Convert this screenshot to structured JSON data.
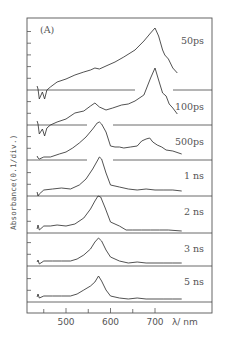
{
  "chart_data": {
    "type": "line",
    "panel_label": "(A)",
    "title": "",
    "xlabel": "λ/ nm",
    "ylabel": "Absorbance(0.1/div.)",
    "xlim": [
      420,
      800
    ],
    "x_ticks": [
      450,
      500,
      550,
      600,
      650,
      700
    ],
    "x_tick_labels": [
      "500",
      "600",
      "700"
    ],
    "x_tick_label_values": [
      500,
      600,
      700
    ],
    "grid": false,
    "legend": "none (series labeled inline at right)",
    "series": [
      {
        "name": "50ps",
        "baseline_y": 90,
        "points": [
          [
            435,
            86
          ],
          [
            437,
            89
          ],
          [
            440,
            99
          ],
          [
            447,
            92
          ],
          [
            452,
            99
          ],
          [
            457,
            90
          ],
          [
            465,
            87
          ],
          [
            480,
            82
          ],
          [
            500,
            79
          ],
          [
            520,
            75
          ],
          [
            540,
            72
          ],
          [
            555,
            70
          ],
          [
            565,
            68
          ],
          [
            575,
            69
          ],
          [
            590,
            66
          ],
          [
            610,
            62
          ],
          [
            630,
            57
          ],
          [
            655,
            50
          ],
          [
            675,
            41
          ],
          [
            690,
            33
          ],
          [
            700,
            28
          ],
          [
            708,
            36
          ],
          [
            717,
            50
          ],
          [
            722,
            55
          ],
          [
            730,
            59
          ],
          [
            740,
            68
          ],
          [
            750,
            73
          ]
        ]
      },
      {
        "name": "100ps",
        "baseline_y": 125,
        "points": [
          [
            435,
            121
          ],
          [
            437,
            124
          ],
          [
            440,
            134
          ],
          [
            447,
            129
          ],
          [
            452,
            136
          ],
          [
            457,
            128
          ],
          [
            465,
            125
          ],
          [
            480,
            122
          ],
          [
            500,
            119
          ],
          [
            520,
            113
          ],
          [
            540,
            111
          ],
          [
            555,
            106
          ],
          [
            565,
            103
          ],
          [
            575,
            107
          ],
          [
            590,
            110
          ],
          [
            605,
            108
          ],
          [
            625,
            105
          ],
          [
            640,
            104
          ],
          [
            655,
            101
          ],
          [
            675,
            95
          ],
          [
            690,
            78
          ],
          [
            700,
            68
          ],
          [
            708,
            80
          ],
          [
            717,
            93
          ],
          [
            725,
            96
          ],
          [
            732,
            104
          ],
          [
            740,
            108
          ],
          [
            750,
            114
          ]
        ]
      },
      {
        "name": "500ps",
        "baseline_y": 160,
        "points": [
          [
            435,
            156
          ],
          [
            437,
            158
          ],
          [
            440,
            159
          ],
          [
            450,
            157
          ],
          [
            465,
            157
          ],
          [
            485,
            154
          ],
          [
            500,
            152
          ],
          [
            515,
            148
          ],
          [
            530,
            143
          ],
          [
            545,
            137
          ],
          [
            560,
            129
          ],
          [
            570,
            123
          ],
          [
            575,
            122
          ],
          [
            580,
            124
          ],
          [
            590,
            132
          ],
          [
            600,
            146
          ],
          [
            610,
            147
          ],
          [
            620,
            147
          ],
          [
            630,
            148
          ],
          [
            645,
            147
          ],
          [
            660,
            146
          ],
          [
            670,
            141
          ],
          [
            680,
            139
          ],
          [
            688,
            138
          ],
          [
            695,
            142
          ],
          [
            705,
            145
          ],
          [
            715,
            147
          ],
          [
            725,
            150
          ],
          [
            740,
            151
          ],
          [
            760,
            154
          ]
        ]
      },
      {
        "name": "1 ns",
        "baseline_y": 196,
        "points": [
          [
            435,
            192
          ],
          [
            437,
            196
          ],
          [
            440,
            194
          ],
          [
            450,
            190
          ],
          [
            470,
            189
          ],
          [
            490,
            188
          ],
          [
            510,
            189
          ],
          [
            530,
            185
          ],
          [
            545,
            179
          ],
          [
            560,
            169
          ],
          [
            570,
            161
          ],
          [
            575,
            157
          ],
          [
            580,
            159
          ],
          [
            590,
            173
          ],
          [
            600,
            185
          ],
          [
            620,
            187
          ],
          [
            640,
            189
          ],
          [
            660,
            190
          ],
          [
            680,
            189
          ],
          [
            700,
            190
          ],
          [
            720,
            190
          ],
          [
            740,
            190
          ],
          [
            760,
            191
          ]
        ]
      },
      {
        "name": "2 ns",
        "baseline_y": 233,
        "points": [
          [
            435,
            229
          ],
          [
            437,
            225
          ],
          [
            440,
            230
          ],
          [
            450,
            226
          ],
          [
            465,
            226
          ],
          [
            480,
            225
          ],
          [
            500,
            226
          ],
          [
            520,
            224
          ],
          [
            540,
            218
          ],
          [
            555,
            209
          ],
          [
            565,
            201
          ],
          [
            572,
            196
          ],
          [
            578,
            197
          ],
          [
            588,
            208
          ],
          [
            600,
            222
          ],
          [
            620,
            226
          ],
          [
            635,
            230
          ],
          [
            650,
            230
          ],
          [
            670,
            230
          ],
          [
            690,
            230
          ],
          [
            710,
            230
          ],
          [
            730,
            230
          ],
          [
            760,
            231
          ]
        ]
      },
      {
        "name": "3 ns",
        "baseline_y": 266,
        "points": [
          [
            435,
            262
          ],
          [
            437,
            260
          ],
          [
            440,
            264
          ],
          [
            450,
            261
          ],
          [
            470,
            261
          ],
          [
            490,
            261
          ],
          [
            510,
            261
          ],
          [
            525,
            259
          ],
          [
            540,
            255
          ],
          [
            555,
            249
          ],
          [
            565,
            242
          ],
          [
            573,
            238
          ],
          [
            580,
            241
          ],
          [
            590,
            250
          ],
          [
            600,
            257
          ],
          [
            620,
            261
          ],
          [
            640,
            263
          ],
          [
            660,
            262
          ],
          [
            680,
            263
          ],
          [
            700,
            263
          ],
          [
            720,
            263
          ],
          [
            740,
            263
          ],
          [
            760,
            263
          ]
        ]
      },
      {
        "name": "5 ns",
        "baseline_y": 302,
        "points": [
          [
            435,
            297
          ],
          [
            437,
            294
          ],
          [
            440,
            298
          ],
          [
            450,
            296
          ],
          [
            470,
            296
          ],
          [
            490,
            296
          ],
          [
            510,
            296
          ],
          [
            525,
            294
          ],
          [
            540,
            290
          ],
          [
            555,
            286
          ],
          [
            565,
            282
          ],
          [
            573,
            276
          ],
          [
            580,
            281
          ],
          [
            590,
            290
          ],
          [
            600,
            296
          ],
          [
            620,
            298
          ],
          [
            640,
            299
          ],
          [
            660,
            298
          ],
          [
            680,
            299
          ],
          [
            700,
            299
          ],
          [
            720,
            299
          ],
          [
            740,
            299
          ],
          [
            760,
            299
          ]
        ]
      }
    ]
  },
  "layout": {
    "frame": {
      "x": 27,
      "y": 18,
      "w": 185,
      "h": 295
    },
    "px_per_nm": 0.445,
    "x_at_500nm": 66,
    "baseline_gaps": {
      "50ps": [
        [
          135,
          173
        ]
      ],
      "100ps": [
        [
          87,
          113
        ]
      ],
      "500ps": [
        [
          87,
          113
        ]
      ]
    }
  }
}
